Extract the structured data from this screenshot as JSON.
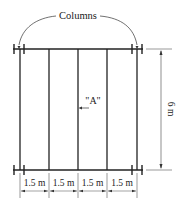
{
  "diagram": {
    "title_label": "Columns",
    "panel_label": "\"A\"",
    "height_dimension": "6 m",
    "spacing_dimensions": [
      "1.5 m",
      "1.5 m",
      "1.5 m",
      "1.5 m"
    ],
    "colors": {
      "line": "#222222",
      "background": "#ffffff"
    }
  }
}
